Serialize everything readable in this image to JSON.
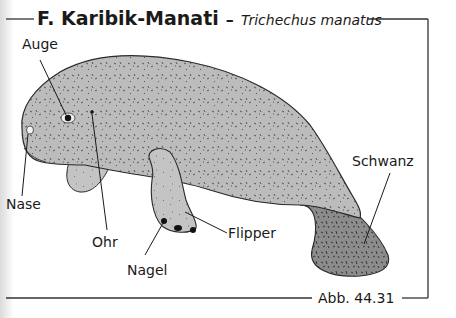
{
  "figure": {
    "title": "F. Karibik-Manati",
    "title_separator": "–",
    "scientific_name": "Trichechus manatus",
    "caption": "Abb. 44.31"
  },
  "labels": {
    "eye": "Auge",
    "nose": "Nase",
    "ear": "Ohr",
    "nail": "Nagel",
    "flipper": "Flipper",
    "tail": "Schwanz"
  },
  "colors": {
    "body": "#b9b9b9",
    "tail": "#8f8f8f",
    "outline": "#2a2a2a",
    "frame": "#333333"
  }
}
